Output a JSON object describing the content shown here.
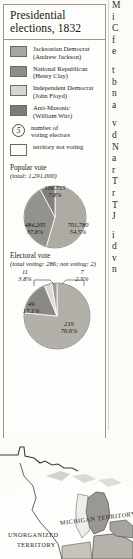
{
  "inset": {
    "title_lines": [
      "Presidential",
      "elections, 1832"
    ],
    "legend": {
      "items": [
        {
          "party": "Jacksonian Democrat",
          "candidate": "(Andrew Jackson)",
          "color": "#a8a6a0"
        },
        {
          "party": "National Republican",
          "candidate": "(Henry Clay)",
          "color": "#8e8c86"
        },
        {
          "party": "Independent Democrat",
          "candidate": "(John Floyd)",
          "color": "#d7d5cd"
        },
        {
          "party": "Anti-Masonic",
          "candidate": "(William Wirt)",
          "color": "#7e7c76"
        }
      ],
      "symbols": [
        {
          "glyph": "5",
          "line1": "number of",
          "line2": "voting electors"
        },
        {
          "glyph": "",
          "line1": "territory not voting",
          "line2": ""
        }
      ]
    }
  },
  "chart_data": [
    {
      "type": "pie",
      "title": "Popular vote",
      "subtitle": "(total: 1,291,000)",
      "categories": [
        "Jacksonian Democrat",
        "National Republican",
        "Anti-Masonic"
      ],
      "values": [
        701780,
        484205,
        100715
      ],
      "percents": [
        "54.5%",
        "37.6%",
        "7.8%"
      ],
      "value_labels": [
        "701,780",
        "484,205",
        "100,715"
      ],
      "colors": [
        "#adaba4",
        "#94928c",
        "#83817b"
      ],
      "legend_position": "none",
      "grid": false
    },
    {
      "type": "pie",
      "title": "Electoral vote",
      "subtitle": "(total voting: 286; not voting: 2)",
      "categories": [
        "Jacksonian Democrat",
        "National Republican",
        "Independent Democrat",
        "Anti-Masonic"
      ],
      "values": [
        219,
        49,
        11,
        7
      ],
      "percents": [
        "76.6%",
        "17.1%",
        "3.8%",
        "2.5%"
      ],
      "value_labels": [
        "219",
        "49",
        "11",
        "7"
      ],
      "colors": [
        "#b2b0a9",
        "#8b8983",
        "#dcdad2",
        "#9c9a94"
      ],
      "legend_position": "none",
      "grid": false
    }
  ],
  "map": {
    "labels": [
      {
        "name": "michigan-territory",
        "text": "MICHIGAN TERRITORY"
      },
      {
        "name": "unorganized-territory-line1",
        "text": "UNORGANIZED"
      },
      {
        "name": "unorganized-territory-line2",
        "text": "TERRITORY"
      }
    ]
  },
  "body_text": {
    "paragraph_1": [
      "M",
      "i",
      "C",
      "f",
      "e"
    ],
    "paragraph_2": [
      "t",
      "b",
      "n",
      "a"
    ],
    "paragraph_3": [
      "v",
      "d",
      "N",
      "a",
      "r",
      "T",
      "r",
      "T",
      "J"
    ],
    "paragraph_4": [
      "i",
      "d",
      "v",
      "n"
    ]
  }
}
